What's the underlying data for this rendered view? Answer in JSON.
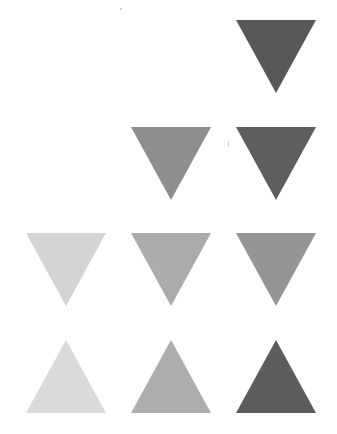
{
  "diagram": {
    "title": "",
    "colors": {
      "dark": "#595959",
      "medium": "#999999",
      "medium_light": "#b0b0b0",
      "light": "#d6d6d6",
      "background": "#ffffff"
    },
    "grid": {
      "rows": 4,
      "columns": 3
    },
    "triangles": [
      {
        "row": 1,
        "col": 3,
        "direction": "down",
        "shade": "dark",
        "fill": "#585858",
        "x": 236,
        "y": 20
      },
      {
        "row": 2,
        "col": 2,
        "direction": "down",
        "shade": "medium",
        "fill": "#8e8e8e",
        "x": 131,
        "y": 127
      },
      {
        "row": 2,
        "col": 3,
        "direction": "down",
        "shade": "dark",
        "fill": "#5e5e5e",
        "x": 236,
        "y": 127
      },
      {
        "row": 3,
        "col": 1,
        "direction": "down",
        "shade": "light",
        "fill": "#d4d4d4",
        "x": 26,
        "y": 233
      },
      {
        "row": 3,
        "col": 2,
        "direction": "down",
        "shade": "medium-light",
        "fill": "#ababab",
        "x": 131,
        "y": 233
      },
      {
        "row": 3,
        "col": 3,
        "direction": "down",
        "shade": "medium",
        "fill": "#959595",
        "x": 236,
        "y": 233
      },
      {
        "row": 4,
        "col": 1,
        "direction": "up",
        "shade": "light",
        "fill": "#dadada",
        "x": 26,
        "y": 340
      },
      {
        "row": 4,
        "col": 2,
        "direction": "up",
        "shade": "medium-light",
        "fill": "#adadad",
        "x": 131,
        "y": 340
      },
      {
        "row": 4,
        "col": 3,
        "direction": "up",
        "shade": "dark",
        "fill": "#5c5c5c",
        "x": 236,
        "y": 340
      }
    ]
  }
}
